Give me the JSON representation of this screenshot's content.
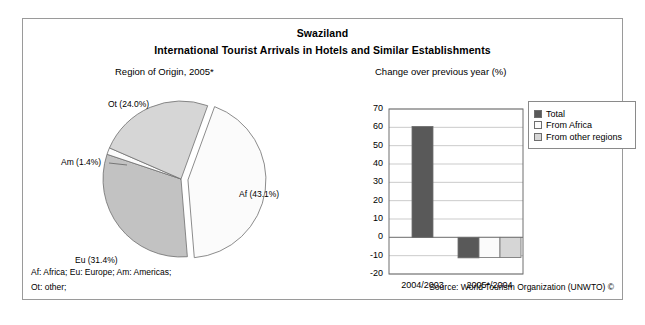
{
  "figure": {
    "title": "Swaziland",
    "subtitle": "International Tourist Arrivals in Hotels and Similar Establishments",
    "footnote_line1": "Af: Africa; Eu: Europe; Am: Americas;",
    "footnote_line2": "Ot: other;",
    "source": "Source: World Tourism Organization (UNWTO) ©",
    "border_color": "#9a9a9a"
  },
  "colors": {
    "dark_gray": "#595959",
    "medium_gray": "#c2c2c2",
    "light_gray": "#d6d6d6",
    "white": "#fbfbfb",
    "outline": "#6e6e6e",
    "grid": "#b5b5b5"
  },
  "chart_data": [
    {
      "type": "pie",
      "title": "Region of Origin, 2005*",
      "xlabel": "",
      "ylabel": "",
      "legend_position": "none",
      "labels": [
        "Af (43.1%)",
        "Eu (31.4%)",
        "Am (1.4%)",
        "Ot (24.0%)"
      ],
      "categories": [
        "Af",
        "Eu",
        "Am",
        "Ot"
      ],
      "values": [
        43.1,
        31.4,
        1.4,
        24.0
      ],
      "slice_colors": [
        "#fbfbfb",
        "#c2c2c2",
        "#fbfbfb",
        "#d6d6d6"
      ],
      "exploded": [
        "Af"
      ]
    },
    {
      "type": "bar",
      "title": "Change over previous year (%)",
      "xlabel": "",
      "ylabel": "",
      "categories": [
        "2004/2003",
        "2005*/2004"
      ],
      "ylim": [
        -20,
        70
      ],
      "yticks": [
        70,
        60,
        50,
        40,
        30,
        20,
        10,
        0,
        -10,
        -20
      ],
      "grid": true,
      "legend_position": "right",
      "series": [
        {
          "name": "Total",
          "values": [
            60.5,
            -11.2
          ],
          "color": "#595959"
        },
        {
          "name": "From Africa",
          "values": [
            null,
            -11.0
          ],
          "color": "#fbfbfb"
        },
        {
          "name": "From other regions",
          "values": [
            null,
            -11.0
          ],
          "color": "#d6d6d6"
        }
      ]
    }
  ]
}
